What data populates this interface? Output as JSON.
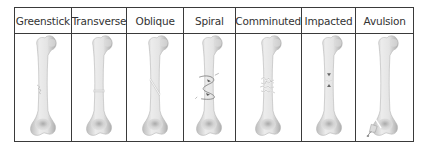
{
  "diagram": {
    "columns": [
      {
        "label": "Greenstick",
        "fracture": "greenstick"
      },
      {
        "label": "Transverse",
        "fracture": "transverse"
      },
      {
        "label": "Oblique",
        "fracture": "oblique"
      },
      {
        "label": "Spiral",
        "fracture": "spiral"
      },
      {
        "label": "Comminuted",
        "fracture": "comminuted"
      },
      {
        "label": "Impacted",
        "fracture": "impacted"
      },
      {
        "label": "Avulsion",
        "fracture": "avulsion"
      }
    ],
    "colors": {
      "border": "#3a3a3a",
      "bone_light": "#e8e8e8",
      "bone_shade": "#a8a8a8",
      "text": "#333333"
    }
  }
}
